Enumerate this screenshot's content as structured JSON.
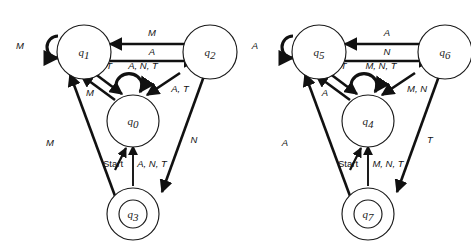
{
  "diagram": {
    "type": "finite-state-machine",
    "title": "",
    "machines": [
      {
        "id": "left-machine",
        "states": [
          {
            "id": "q0",
            "label": "q",
            "sub": "0",
            "role": "center",
            "accepting": false,
            "start": true
          },
          {
            "id": "q1",
            "label": "q",
            "sub": "1",
            "role": "top-left",
            "accepting": false,
            "start": false
          },
          {
            "id": "q2",
            "label": "q",
            "sub": "2",
            "role": "top-right",
            "accepting": false,
            "start": false
          },
          {
            "id": "q3",
            "label": "q",
            "sub": "3",
            "role": "bottom",
            "accepting": true,
            "start": false
          }
        ],
        "start_label": "Start",
        "transitions": [
          {
            "id": "l-q1-self",
            "from": "q1",
            "to": "q1",
            "label": "M",
            "kind": "self-loop"
          },
          {
            "id": "l-q2-q1",
            "from": "q2",
            "to": "q1",
            "label": "M",
            "kind": "straight"
          },
          {
            "id": "l-q1-q2",
            "from": "q1",
            "to": "q2",
            "label": "A",
            "kind": "straight"
          },
          {
            "id": "l-q1-q0",
            "from": "q1",
            "to": "q0",
            "label": "N, T",
            "kind": "diagonal"
          },
          {
            "id": "l-q0-q1",
            "from": "q0",
            "to": "q1",
            "label": "M",
            "kind": "diagonal"
          },
          {
            "id": "l-q0-self",
            "from": "q0",
            "to": "q0",
            "label": "A, N, T",
            "kind": "self-loop"
          },
          {
            "id": "l-q2-q0",
            "from": "q2",
            "to": "q0",
            "label": "A, T",
            "kind": "diagonal"
          },
          {
            "id": "l-q2-q3",
            "from": "q2",
            "to": "q3",
            "label": "N",
            "kind": "diagonal"
          },
          {
            "id": "l-q3-q1",
            "from": "q3",
            "to": "q1",
            "label": "M",
            "kind": "diagonal"
          },
          {
            "id": "l-q3-q0",
            "from": "q3",
            "to": "q0",
            "label": "A, N, T",
            "kind": "straight"
          }
        ]
      },
      {
        "id": "right-machine",
        "states": [
          {
            "id": "q4",
            "label": "q",
            "sub": "4",
            "role": "center",
            "accepting": false,
            "start": true
          },
          {
            "id": "q5",
            "label": "q",
            "sub": "5",
            "role": "top-left",
            "accepting": false,
            "start": false
          },
          {
            "id": "q6",
            "label": "q",
            "sub": "6",
            "role": "top-right",
            "accepting": false,
            "start": false
          },
          {
            "id": "q7",
            "label": "q",
            "sub": "7",
            "role": "bottom",
            "accepting": true,
            "start": false
          }
        ],
        "start_label": "Start",
        "transitions": [
          {
            "id": "r-q5-self",
            "from": "q5",
            "to": "q5",
            "label": "A",
            "kind": "self-loop"
          },
          {
            "id": "r-q6-q5",
            "from": "q6",
            "to": "q5",
            "label": "A",
            "kind": "straight"
          },
          {
            "id": "r-q5-q6",
            "from": "q5",
            "to": "q6",
            "label": "N",
            "kind": "straight"
          },
          {
            "id": "r-q5-q4",
            "from": "q5",
            "to": "q4",
            "label": "M, T",
            "kind": "diagonal"
          },
          {
            "id": "r-q4-q5",
            "from": "q4",
            "to": "q5",
            "label": "A",
            "kind": "diagonal"
          },
          {
            "id": "r-q4-self",
            "from": "q4",
            "to": "q4",
            "label": "M, N, T",
            "kind": "self-loop"
          },
          {
            "id": "r-q6-q4",
            "from": "q6",
            "to": "q4",
            "label": "M, N",
            "kind": "diagonal"
          },
          {
            "id": "r-q6-q7",
            "from": "q6",
            "to": "q7",
            "label": "T",
            "kind": "diagonal"
          },
          {
            "id": "r-q7-q5",
            "from": "q7",
            "to": "q5",
            "label": "A",
            "kind": "diagonal"
          },
          {
            "id": "r-q7-q4",
            "from": "q7",
            "to": "q4",
            "label": "M, N, T",
            "kind": "straight"
          }
        ]
      }
    ]
  }
}
